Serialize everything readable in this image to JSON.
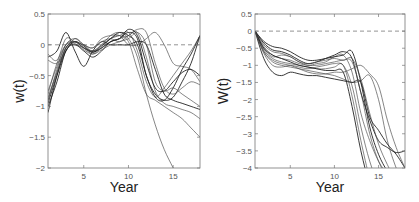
{
  "chart_data": [
    {
      "type": "line",
      "title": "",
      "xlabel": "Year",
      "ylabel": "w(t)",
      "xlim": [
        1,
        18
      ],
      "ylim": [
        -2,
        0.5
      ],
      "xticks": [
        5,
        10,
        15
      ],
      "yticks": [
        0.5,
        0,
        -0.5,
        -1,
        -1.5,
        -2
      ],
      "ytick_labels": [
        "0.5",
        "0",
        "-0.5",
        "-1",
        "-1.5",
        "-2"
      ],
      "grid": false,
      "reference_line": {
        "y": 0,
        "style": "dashed"
      },
      "x": [
        1,
        2,
        3,
        4,
        5,
        6,
        7,
        8,
        9,
        10,
        11,
        12,
        13,
        14,
        15,
        16,
        17,
        18
      ],
      "series": [
        {
          "name": "s1",
          "values": [
            -1.1,
            -0.5,
            -0.05,
            0.05,
            -0.05,
            -0.12,
            -0.05,
            0.05,
            0.1,
            0.2,
            0.1,
            -0.5,
            -0.8,
            -0.9,
            -0.85,
            -0.6,
            -0.3,
            0.15
          ]
        },
        {
          "name": "s2",
          "values": [
            -0.9,
            -0.4,
            0.0,
            0.05,
            -0.05,
            -0.1,
            0.0,
            0.1,
            0.15,
            0.2,
            -0.1,
            -0.6,
            -0.85,
            -0.7,
            -0.5,
            -0.3,
            -0.1,
            0.15
          ]
        },
        {
          "name": "s3",
          "values": [
            -0.8,
            -0.3,
            0.0,
            0.02,
            -0.08,
            -0.15,
            -0.05,
            0.05,
            0.1,
            0.15,
            0.2,
            -0.2,
            -0.75,
            -0.95,
            -1.0,
            -1.05,
            -1.1,
            -1.2
          ]
        },
        {
          "name": "s4",
          "values": [
            -0.2,
            -0.1,
            0.2,
            -0.1,
            -0.35,
            -0.1,
            0.05,
            0.0,
            0.0,
            0.0,
            0.05,
            0.0,
            -0.4,
            -0.8,
            -0.9,
            -0.95,
            -1.0,
            -1.05
          ]
        },
        {
          "name": "s5",
          "values": [
            -0.15,
            -0.25,
            0.1,
            0.05,
            0.0,
            -0.05,
            0.1,
            0.15,
            0.15,
            0.0,
            0.0,
            0.1,
            0.2,
            0.0,
            -0.3,
            -0.35,
            -0.4,
            -0.6
          ]
        },
        {
          "name": "s6",
          "values": [
            -0.25,
            -0.3,
            -0.1,
            0.1,
            0.0,
            -0.1,
            0.0,
            0.15,
            0.2,
            0.1,
            -0.2,
            -0.8,
            -1.3,
            -1.7,
            -2.0,
            -2.3,
            -2.6,
            -2.9
          ]
        },
        {
          "name": "s7",
          "values": [
            -1.0,
            -0.6,
            -0.1,
            0.0,
            -0.1,
            -0.2,
            -0.1,
            0.05,
            0.1,
            0.25,
            0.15,
            -0.3,
            -0.7,
            -0.75,
            -0.6,
            -0.45,
            -0.4,
            -0.5
          ]
        },
        {
          "name": "s8",
          "values": [
            -0.85,
            -0.45,
            -0.05,
            0.0,
            -0.05,
            -0.1,
            -0.05,
            0.1,
            0.15,
            0.05,
            -0.4,
            -0.8,
            -0.9,
            -1.0,
            -1.1,
            -1.2,
            -1.35,
            -1.5
          ]
        },
        {
          "name": "s9",
          "values": [
            -0.75,
            -0.35,
            0.0,
            0.1,
            0.0,
            -0.05,
            0.05,
            0.1,
            0.05,
            0.15,
            0.25,
            0.2,
            -0.3,
            -0.7,
            -0.8,
            -0.7,
            -0.6,
            -0.65
          ]
        },
        {
          "name": "s10",
          "values": [
            -0.95,
            -0.5,
            -0.1,
            0.05,
            -0.02,
            -0.12,
            -0.02,
            0.1,
            0.2,
            0.15,
            0.0,
            -0.5,
            -0.85,
            -0.9,
            -0.7,
            -0.4,
            -0.15,
            0.15
          ]
        },
        {
          "name": "s11",
          "values": [
            -0.9,
            -0.45,
            -0.05,
            0.05,
            -0.05,
            -0.15,
            -0.08,
            0.0,
            0.05,
            0.1,
            0.2,
            0.0,
            -0.6,
            -0.75,
            -0.7,
            -0.8,
            -0.9,
            -1.0
          ]
        }
      ]
    },
    {
      "type": "line",
      "title": "",
      "xlabel": "Year",
      "ylabel": "W(t)",
      "xlim": [
        1,
        18
      ],
      "ylim": [
        -4,
        0.5
      ],
      "xticks": [
        5,
        10,
        15
      ],
      "yticks": [
        0.5,
        0,
        -0.5,
        -1,
        -1.5,
        -2,
        -2.5,
        -3,
        -3.5,
        -4
      ],
      "ytick_labels": [
        "0.5",
        "0",
        "-0.5",
        "-1",
        "-1.5",
        "-2",
        "-2.5",
        "-3",
        "-3.5",
        "-4"
      ],
      "grid": false,
      "reference_line": {
        "y": 0,
        "style": "dashed"
      },
      "x": [
        1,
        2,
        3,
        4,
        5,
        6,
        7,
        8,
        9,
        10,
        11,
        12,
        13,
        14,
        15,
        16,
        17,
        18
      ],
      "series": [
        {
          "name": "S1",
          "values": [
            0,
            -0.35,
            -0.55,
            -0.6,
            -0.7,
            -0.85,
            -0.95,
            -0.9,
            -0.8,
            -0.7,
            -0.6,
            -0.8,
            -1.8,
            -2.6,
            -3.2,
            -3.4,
            -3.55,
            -3.5
          ]
        },
        {
          "name": "S2",
          "values": [
            0,
            -0.5,
            -0.75,
            -0.7,
            -0.75,
            -0.9,
            -1.0,
            -0.95,
            -0.9,
            -0.75,
            -0.7,
            -1.2,
            -2.4,
            -3.2,
            -3.8,
            -4.2,
            -4.6,
            -5.0
          ]
        },
        {
          "name": "S3",
          "values": [
            0,
            -0.6,
            -0.9,
            -1.0,
            -1.05,
            -1.1,
            -1.15,
            -1.2,
            -1.25,
            -1.3,
            -1.4,
            -1.5,
            -1.45,
            -1.3,
            -2.0,
            -3.2,
            -4.0,
            -4.6
          ]
        },
        {
          "name": "S4",
          "values": [
            0,
            -0.8,
            -1.2,
            -1.3,
            -1.2,
            -1.25,
            -1.3,
            -1.3,
            -1.35,
            -1.4,
            -1.45,
            -1.5,
            -1.5,
            -2.5,
            -2.9,
            -3.3,
            -3.6,
            -4.0
          ]
        },
        {
          "name": "S5",
          "values": [
            0,
            -0.45,
            -0.7,
            -0.8,
            -0.85,
            -0.95,
            -1.0,
            -1.0,
            -0.95,
            -0.9,
            -0.85,
            -0.9,
            -1.8,
            -3.0,
            -3.8,
            -4.3,
            -4.6,
            -5.0
          ]
        },
        {
          "name": "S6",
          "values": [
            0,
            -0.55,
            -0.8,
            -0.9,
            -0.95,
            -1.0,
            -1.05,
            -1.1,
            -1.1,
            -1.05,
            -1.0,
            -1.9,
            -3.2,
            -4.3,
            -5.0,
            -5.5,
            -6.0,
            -6.5
          ]
        },
        {
          "name": "S7",
          "values": [
            0,
            -0.3,
            -0.45,
            -0.5,
            -0.6,
            -0.75,
            -0.85,
            -0.85,
            -0.8,
            -0.75,
            -0.7,
            -0.6,
            -1.5,
            -2.8,
            -3.6,
            -4.1,
            -4.5,
            -4.9
          ]
        },
        {
          "name": "S8",
          "values": [
            0,
            -0.65,
            -1.0,
            -1.05,
            -1.0,
            -1.05,
            -1.1,
            -1.05,
            -1.0,
            -0.95,
            -1.0,
            -1.6,
            -2.8,
            -3.8,
            -4.5,
            -5.0,
            -5.5,
            -6.0
          ]
        },
        {
          "name": "S9",
          "values": [
            0,
            -0.4,
            -0.6,
            -0.65,
            -0.75,
            -0.9,
            -0.95,
            -0.9,
            -0.85,
            -0.8,
            -0.85,
            -0.8,
            -1.4,
            -2.4,
            -3.3,
            -3.9,
            -4.4,
            -4.8
          ]
        },
        {
          "name": "S10",
          "values": [
            0,
            -0.5,
            -0.7,
            -0.8,
            -0.9,
            -1.0,
            -1.05,
            -1.1,
            -1.15,
            -1.15,
            -1.2,
            -2.2,
            -3.5,
            -4.5,
            -5.2,
            -5.8,
            -6.3,
            -6.8
          ]
        },
        {
          "name": "S11",
          "values": [
            0,
            -0.6,
            -0.85,
            -0.95,
            -1.0,
            -1.1,
            -1.2,
            -1.25,
            -1.25,
            -1.2,
            -1.2,
            -1.1,
            -1.0,
            -1.25,
            -1.6,
            -2.6,
            -3.4,
            -4.0
          ]
        }
      ]
    }
  ],
  "panels": [
    {
      "xlabel": "Year",
      "ylabel": "w(t)"
    },
    {
      "xlabel": "Year",
      "ylabel": "W(t)"
    }
  ]
}
